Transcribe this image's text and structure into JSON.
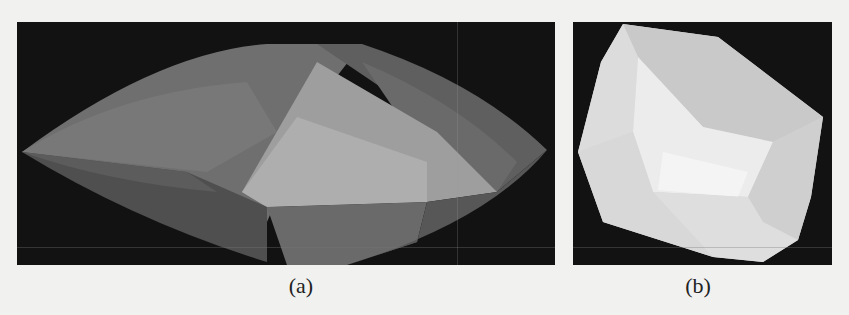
{
  "figure": {
    "panels": [
      {
        "id": "a",
        "caption": "(a)",
        "description": "Rendered 3D polyhedron, elongated lens shape",
        "background_color": "#121212",
        "face_colors": [
          "#6e6e6e",
          "#7a7a7a",
          "#8c8c8c",
          "#9e9e9e",
          "#b5b5b5",
          "#5e5e5e",
          "#4a4a4a"
        ]
      },
      {
        "id": "b",
        "caption": "(b)",
        "description": "Rendered 3D polyhedron, bright faceted block",
        "background_color": "#121212",
        "face_colors": [
          "#d9d9d9",
          "#e6e6e6",
          "#f2f2f2",
          "#cfcfcf",
          "#c4c4c4"
        ]
      }
    ]
  }
}
